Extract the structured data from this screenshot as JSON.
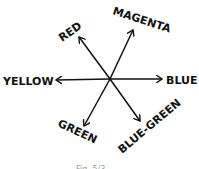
{
  "diagram": {
    "type": "color-opponent-axes",
    "center": {
      "x": 110,
      "y": 79
    },
    "axes": [
      {
        "label": "RED",
        "tip": {
          "x": 79,
          "y": 37
        }
      },
      {
        "label": "MAGENTA",
        "tip": {
          "x": 133,
          "y": 30
        }
      },
      {
        "label": "YELLOW",
        "tip": {
          "x": 56,
          "y": 80
        }
      },
      {
        "label": "BLUE",
        "tip": {
          "x": 162,
          "y": 79
        }
      },
      {
        "label": "GREEN",
        "tip": {
          "x": 84,
          "y": 126
        }
      },
      {
        "label": "BLUE-GREEN",
        "tip": {
          "x": 140,
          "y": 121
        }
      }
    ],
    "caption": "Fig. 5/3"
  }
}
